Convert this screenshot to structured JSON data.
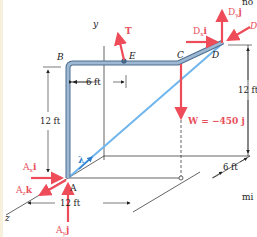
{
  "figure": {
    "colors": {
      "force": "#ee4c58",
      "pipe": "#7f9fbd",
      "pipe_edge": "#4f6f8f",
      "cable": "#6fb6ee",
      "line": "#222222",
      "background": "#ffffff"
    },
    "points": {
      "A": "A",
      "B": "B",
      "C": "C",
      "D": "D",
      "E": "E"
    },
    "axes": {
      "y": "y",
      "z": "z"
    },
    "forces": {
      "T": "T",
      "Dx": "D",
      "Dx_sub": "x",
      "Dx_unit": "i",
      "Dy": "D",
      "Dy_sub": "y",
      "Dy_unit": "j",
      "Dz": "D",
      "Ax": "A",
      "Ax_sub": "x",
      "Ax_unit": "i",
      "Az": "A",
      "Az_sub": "z",
      "Az_unit": "k",
      "Ay": "A",
      "Ay_sub": "y",
      "Ay_unit": "j",
      "W": "W = −450 j"
    },
    "unit_vector": "λ",
    "dimensions": {
      "BE": "6 ft",
      "AB": "12 ft",
      "D_height": "12 ft",
      "depth": "6 ft",
      "width": "12 ft"
    },
    "clipped_text": {
      "top": "no",
      "right": "mi"
    }
  }
}
